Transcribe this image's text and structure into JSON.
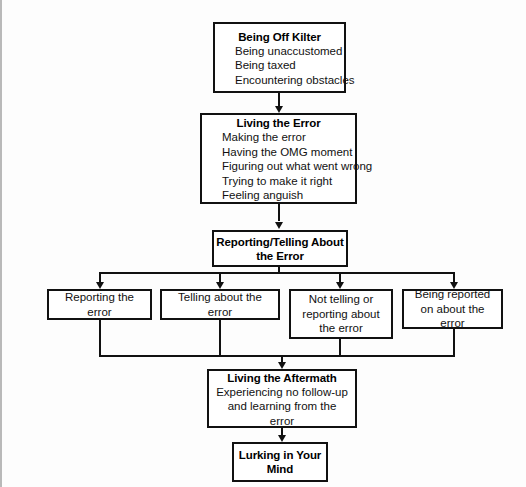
{
  "diagram": {
    "type": "flowchart",
    "background_color": "#fdfdfd",
    "line_color": "#111111",
    "box_fill": "#ffffff",
    "nodes": [
      {
        "id": "being-off-kilter",
        "title": "Being Off Kilter",
        "items": [
          "Being unaccustomed",
          "Being taxed",
          "Encountering obstacles"
        ]
      },
      {
        "id": "living-the-error",
        "title": "Living the Error",
        "items": [
          "Making the error",
          "Having the OMG moment",
          "Figuring out what went wrong",
          "Trying to make it right",
          "Feeling anguish"
        ]
      },
      {
        "id": "reporting-telling",
        "title": "Reporting/Telling About the Error",
        "items": []
      },
      {
        "id": "reporting-the-error",
        "label": "Reporting the error"
      },
      {
        "id": "telling-about-the-error",
        "label": "Telling about the error"
      },
      {
        "id": "not-telling-or-reporting",
        "label": "Not telling or reporting about the error"
      },
      {
        "id": "being-reported-on",
        "label": "Being reported on about the error"
      },
      {
        "id": "living-the-aftermath",
        "title": "Living the Aftermath",
        "items": [
          "Experiencing no follow-up and learning from the error"
        ]
      },
      {
        "id": "lurking-in-your-mind",
        "title": "Lurking in Your Mind",
        "items": []
      }
    ]
  },
  "labels": {
    "n1_title": "Being Off Kilter",
    "n1_i1": "Being unaccustomed",
    "n1_i2": "Being taxed",
    "n1_i3": "Encountering obstacles",
    "n2_title": "Living the Error",
    "n2_i1": "Making the error",
    "n2_i2": "Having the OMG moment",
    "n2_i3": "Figuring out what went wrong",
    "n2_i4": "Trying to make it right",
    "n2_i5": "Feeling anguish",
    "n3_title": "Reporting/Telling About the Error",
    "n4_label": "Reporting the error",
    "n5_label": "Telling about the error",
    "n6_label": "Not telling or reporting about the error",
    "n7_label": "Being reported on about the error",
    "n8_title": "Living the Aftermath",
    "n8_i1": "Experiencing no follow-up and learning from the error",
    "n9_title": "Lurking in Your Mind"
  }
}
